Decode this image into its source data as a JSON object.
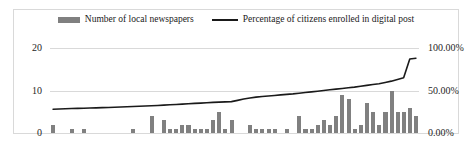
{
  "chart_data": {
    "type": "bar",
    "title": "",
    "xlabel": "",
    "ylabel": "",
    "y2label": "",
    "grid": true,
    "legend_position": "top",
    "colors": {
      "bar": "#808080",
      "line": "#1a1a1a",
      "grid": "#d9d9d9",
      "border": "#d9d9d9",
      "text": "#262626"
    },
    "legend": [
      {
        "label": "Number of local newspapers",
        "marker": "bar",
        "color": "#808080"
      },
      {
        "label": "Percentage of citizens enrolled in digital post",
        "marker": "line",
        "color": "#1a1a1a"
      }
    ],
    "axes": {
      "left": {
        "ticks": [
          "0",
          "10",
          "20"
        ],
        "values": [
          0,
          10,
          20
        ],
        "min": 0,
        "max": 20
      },
      "right": {
        "ticks": [
          "0.00%",
          "50.00%",
          "100.00%"
        ],
        "values": [
          0,
          50,
          100
        ],
        "min": 0,
        "max": 100
      },
      "x": {
        "ticks": [],
        "count": 60
      }
    },
    "categories": [
      "1",
      "2",
      "3",
      "4",
      "5",
      "6",
      "7",
      "8",
      "9",
      "10",
      "11",
      "12",
      "13",
      "14",
      "15",
      "16",
      "17",
      "18",
      "19",
      "20",
      "21",
      "22",
      "23",
      "24",
      "25",
      "26",
      "27",
      "28",
      "29",
      "30",
      "31",
      "32",
      "33",
      "34",
      "35",
      "36",
      "37",
      "38",
      "39",
      "40",
      "41",
      "42",
      "43",
      "44",
      "45",
      "46",
      "47",
      "48",
      "49",
      "50",
      "51",
      "52",
      "53",
      "54",
      "55",
      "56",
      "57",
      "58",
      "59",
      "60"
    ],
    "series": [
      {
        "name": "Number of local newspapers",
        "type": "bar",
        "axis": "left",
        "color": "#808080",
        "values": [
          2,
          0,
          0,
          1,
          0,
          1,
          0,
          0,
          0,
          0,
          0,
          0,
          0,
          1,
          0,
          0,
          4,
          0,
          3,
          1,
          1,
          2,
          2,
          1,
          1,
          1,
          3,
          5,
          1,
          3,
          0,
          0,
          2,
          1,
          1,
          1,
          1,
          0,
          1,
          0,
          4,
          1,
          1,
          2,
          3,
          2,
          4,
          9,
          8,
          1,
          2,
          7,
          5,
          2,
          5,
          10,
          5,
          5,
          6,
          4
        ]
      },
      {
        "name": "Percentage of citizens enrolled in digital post",
        "type": "line",
        "axis": "right",
        "color": "#1a1a1a",
        "values": [
          28,
          28.3,
          28.6,
          28.8,
          29,
          29.2,
          29.4,
          29.6,
          29.8,
          30,
          30.3,
          30.6,
          30.9,
          31.2,
          31.5,
          31.8,
          32.1,
          32.4,
          32.8,
          33.2,
          33.6,
          34,
          34.4,
          34.8,
          35.2,
          35.6,
          36,
          36.3,
          36.6,
          36.9,
          38.4,
          40,
          41.2,
          42.2,
          43,
          43.6,
          44.2,
          44.8,
          45.4,
          46,
          46.8,
          47.6,
          48.4,
          49.2,
          50,
          50.8,
          51.6,
          52.4,
          53.2,
          54,
          55,
          56,
          57,
          58,
          59.5,
          61,
          63,
          65,
          87,
          88
        ]
      }
    ]
  }
}
